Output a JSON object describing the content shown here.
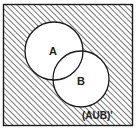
{
  "diagram": {
    "type": "venn",
    "shaded_region": "complement of A union B",
    "sets": [
      {
        "name": "A",
        "label": "A"
      },
      {
        "name": "B",
        "label": "B"
      }
    ],
    "region_label": "(AUB)'",
    "colors": {
      "stroke": "#1a1a1a",
      "hatch": "#555555",
      "background": "#ffffff"
    }
  }
}
